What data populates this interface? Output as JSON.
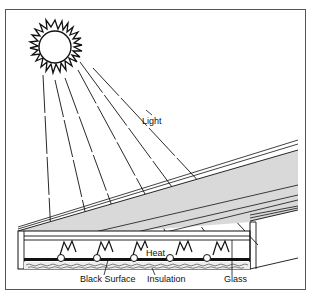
{
  "diagram": {
    "type": "solar-collector-cross-section",
    "labels": {
      "light": "Light",
      "heat": "Heat",
      "black_surface": "Black Surface",
      "insulation": "Insulation",
      "glass": "Glass"
    },
    "colors": {
      "line": "#111111",
      "glass_fill": "#d9d9d9",
      "frame": "#555555",
      "background": "#ffffff"
    }
  }
}
